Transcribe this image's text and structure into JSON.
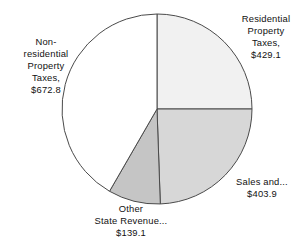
{
  "chart_data": {
    "type": "pie",
    "title": "",
    "subtitle": "",
    "xlabel": "",
    "ylabel": "",
    "units": "$ millions",
    "total": 1644.9,
    "legend_position": "none",
    "grid": false,
    "start_angle_deg": 0,
    "direction": "clockwise",
    "categories": [
      "Residential Property Taxes",
      "Sales and...",
      "Other State Revenue...",
      "Non-residential Property Taxes"
    ],
    "values": [
      429.1,
      403.9,
      139.1,
      672.8
    ],
    "slices": [
      {
        "name": "residential-property-taxes",
        "label_text": "Residential\nProperty\nTaxes,\n$429.1",
        "value": 429.1,
        "value_text": "$429.1",
        "percent": 26.1,
        "angle_deg": 90.0,
        "start_deg": 0.0,
        "end_deg": 90.0,
        "fill": "#f1f1f1",
        "stroke": "#4a4a4a"
      },
      {
        "name": "sales-and-truncated",
        "label_text": "Sales and...\n$403.9",
        "value": 403.9,
        "value_text": "$403.9",
        "percent": 24.6,
        "angle_deg": 88.0,
        "start_deg": 90.0,
        "end_deg": 178.0,
        "fill": "#d7d7d7",
        "stroke": "#4a4a4a"
      },
      {
        "name": "other-state-revenue-truncated",
        "label_text": "Other\nState Revenue...\n$139.1",
        "value": 139.1,
        "value_text": "$139.1",
        "percent": 8.5,
        "angle_deg": 32.0,
        "start_deg": 178.0,
        "end_deg": 210.0,
        "fill": "#c5c5c5",
        "stroke": "#4a4a4a"
      },
      {
        "name": "non-residential-property-taxes",
        "label_text": "Non-\nresidential\nProperty\nTaxes,\n$672.8",
        "value": 672.8,
        "value_text": "$672.8",
        "percent": 40.9,
        "angle_deg": 150.0,
        "start_deg": 210.0,
        "end_deg": 360.0,
        "fill": "#ffffff",
        "stroke": "#4a4a4a"
      }
    ],
    "geometry": {
      "center_x": 157,
      "center_y": 109,
      "radius": 95
    }
  },
  "colors": {
    "background": "#ffffff",
    "outline": "#4a4a4a",
    "text": "#111111"
  }
}
